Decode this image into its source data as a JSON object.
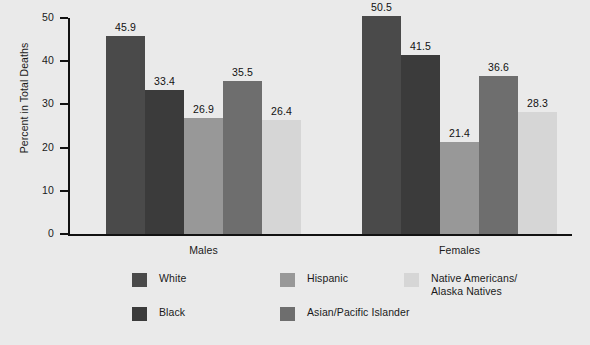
{
  "chart_data": {
    "type": "bar",
    "title": "",
    "subtitle": "",
    "xlabel": "",
    "ylabel": "Percent in Total Deaths",
    "ylim": [
      0,
      50
    ],
    "yticks": [
      0,
      10,
      20,
      30,
      40,
      50
    ],
    "ytick_labels": [
      "0",
      "10",
      "20",
      "30",
      "40",
      "50"
    ],
    "grid": false,
    "legend_position": "bottom",
    "categories": [
      "Males",
      "Females"
    ],
    "series": [
      {
        "name": "White",
        "color": "#4a4a4a",
        "values": [
          45.9,
          50.5
        ]
      },
      {
        "name": "Black",
        "color": "#3b3b3b",
        "values": [
          33.4,
          41.5
        ]
      },
      {
        "name": "Hispanic",
        "color": "#989898",
        "values": [
          26.9,
          21.4
        ]
      },
      {
        "name": "Asian/Pacific Islander",
        "color": "#6e6e6e",
        "values": [
          35.5,
          36.6
        ]
      },
      {
        "name": "Native Americans/\nAlaska Natives",
        "color": "#d6d6d6",
        "values": [
          26.4,
          28.3
        ]
      }
    ],
    "value_labels": {
      "Males": [
        "45.9",
        "33.4",
        "26.9",
        "35.5",
        "26.4"
      ],
      "Females": [
        "50.5",
        "41.5",
        "21.4",
        "36.6",
        "28.3"
      ]
    }
  },
  "axis": {
    "y_title": "Percent in Total Deaths",
    "ticks": [
      "50",
      "40",
      "30",
      "20",
      "10",
      "0"
    ]
  },
  "groups": [
    {
      "label": "Males"
    },
    {
      "label": "Females"
    }
  ],
  "legend": {
    "entries": [
      {
        "label": "White",
        "color": "#4a4a4a"
      },
      {
        "label": "Black",
        "color": "#3b3b3b"
      },
      {
        "label": "Hispanic",
        "color": "#989898"
      },
      {
        "label": "Asian/Pacific Islander",
        "color": "#6e6e6e"
      },
      {
        "label": "Native Americans/\nAlaska Natives",
        "color": "#d6d6d6"
      }
    ]
  },
  "colors": {
    "background": "#eaeaea",
    "axis": "#121212",
    "text": "#1a1a1a"
  }
}
